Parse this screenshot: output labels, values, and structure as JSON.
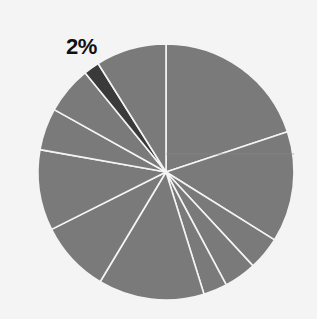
{
  "chart_data": {
    "type": "pie",
    "title": "",
    "start_angle_deg": 0,
    "direction": "clockwise",
    "slices": [
      {
        "value": 19.9,
        "color": "#7a7a7a"
      },
      {
        "value": 14.0,
        "color": "#7a7a7a"
      },
      {
        "value": 4.2,
        "color": "#7a7a7a"
      },
      {
        "value": 4.1,
        "color": "#7a7a7a"
      },
      {
        "value": 3.0,
        "color": "#7a7a7a"
      },
      {
        "value": 13.4,
        "color": "#7a7a7a"
      },
      {
        "value": 9.0,
        "color": "#7a7a7a"
      },
      {
        "value": 10.2,
        "color": "#7a7a7a"
      },
      {
        "value": 5.3,
        "color": "#7a7a7a"
      },
      {
        "value": 6.0,
        "color": "#7a7a7a"
      },
      {
        "value": 2.0,
        "color": "#3a3a3a",
        "highlighted": true,
        "label": "2%"
      },
      {
        "value": 8.9,
        "color": "#7a7a7a"
      }
    ],
    "annotations": [
      {
        "text": "2%",
        "slice_index": 10
      }
    ],
    "legend": null
  },
  "label": {
    "text": "2%"
  },
  "colors": {
    "slice": "#7a7a7a",
    "highlight": "#3a3a3a",
    "separator": "#f4f4f4",
    "background": "#f4f4f4"
  }
}
